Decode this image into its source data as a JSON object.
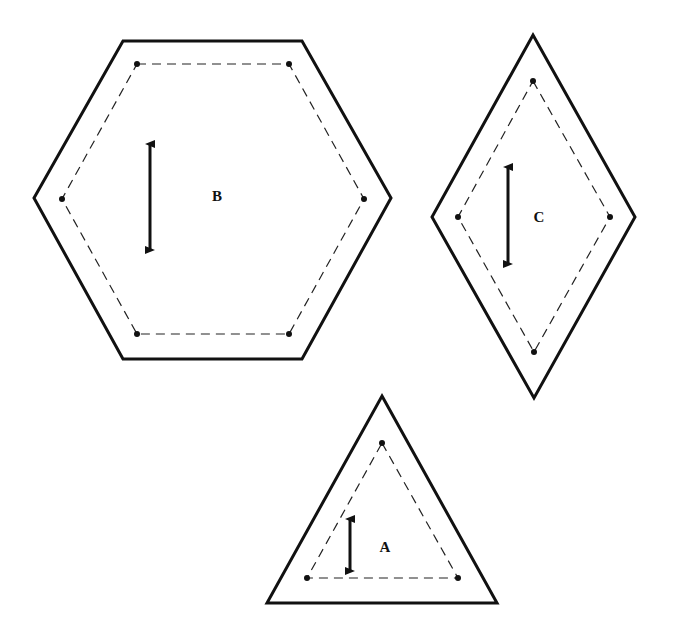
{
  "diagram": {
    "colors": {
      "line": "#111111",
      "background": "#ffffff"
    },
    "pieces": [
      {
        "id": "B",
        "label": "B",
        "shape": "hexagon",
        "outer": "123,41 302,41 391,198 302,359 123,359 34,198",
        "inner": "137,64 289,64 364,199 289,334 137,334 62,199",
        "dots": [
          [
            137,
            64
          ],
          [
            289,
            64
          ],
          [
            364,
            199
          ],
          [
            289,
            334
          ],
          [
            137,
            334
          ],
          [
            62,
            199
          ]
        ],
        "arrow": {
          "x": 150,
          "y1": 138,
          "y2": 256
        },
        "label_pos": [
          217,
          201
        ]
      },
      {
        "id": "C",
        "label": "C",
        "shape": "diamond",
        "outer": "533,35 635,217 534,398 432,217",
        "inner": "533,81 610,217 534,352 458,217",
        "dots": [
          [
            533,
            81
          ],
          [
            610,
            217
          ],
          [
            534,
            352
          ],
          [
            458,
            217
          ]
        ],
        "arrow": {
          "x": 508,
          "y1": 161,
          "y2": 270
        },
        "label_pos": [
          539,
          222
        ]
      },
      {
        "id": "A",
        "label": "A",
        "shape": "triangle",
        "outer": "382,396 497,603 267,603",
        "inner": "382,443 458,578 307,578",
        "dots": [
          [
            382,
            443
          ],
          [
            458,
            578
          ],
          [
            307,
            578
          ]
        ],
        "arrow": {
          "x": 350,
          "y1": 513,
          "y2": 577
        },
        "label_pos": [
          385,
          552
        ]
      }
    ]
  }
}
